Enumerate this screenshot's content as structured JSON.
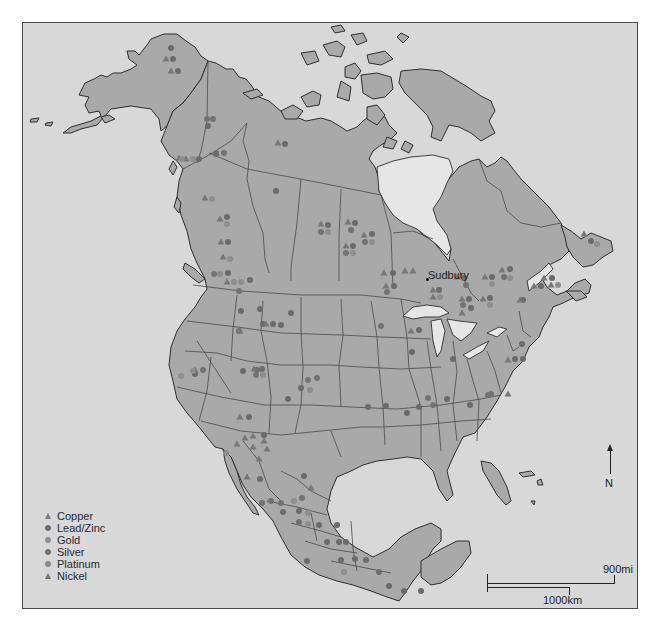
{
  "map": {
    "title": "North American mineral deposits",
    "colors": {
      "ocean": "#d8d8d8",
      "land": "#a9a9a9",
      "lakes": "#e6e6e6",
      "outline": "#2e2e2e",
      "symbol_dark": "#6e6e6e",
      "symbol_light": "#8d8d8d"
    },
    "labels": [
      {
        "name": "Sudbury",
        "x": 428,
        "y": 270,
        "dot_x": 426,
        "dot_y": 278
      }
    ]
  },
  "legend": {
    "items": [
      {
        "label": "Copper",
        "shape": "triangle",
        "color": "#7a7a7a"
      },
      {
        "label": "Lead/Zinc",
        "shape": "circle",
        "color": "#6e6e6e"
      },
      {
        "label": "Gold",
        "shape": "circle",
        "color": "#8f8f8f"
      },
      {
        "label": "Silver",
        "shape": "circle",
        "color": "#747474"
      },
      {
        "label": "Platinum",
        "shape": "circle",
        "color": "#8a8a8a"
      },
      {
        "label": "Nickel",
        "shape": "triangle",
        "color": "#6f6f6f"
      }
    ]
  },
  "north_arrow": {
    "label": "N"
  },
  "scale_bar": {
    "miles_label": "900mi",
    "km_label": "1000km"
  },
  "deposits": [
    {
      "t": "lead",
      "x": 170,
      "y": 47
    },
    {
      "t": "copper",
      "x": 165,
      "y": 58
    },
    {
      "t": "lead",
      "x": 172,
      "y": 58
    },
    {
      "t": "copper",
      "x": 170,
      "y": 70
    },
    {
      "t": "lead",
      "x": 177,
      "y": 70
    },
    {
      "t": "silver",
      "x": 206,
      "y": 118
    },
    {
      "t": "silver",
      "x": 212,
      "y": 118
    },
    {
      "t": "copper",
      "x": 185,
      "y": 158
    },
    {
      "t": "gold",
      "x": 192,
      "y": 158
    },
    {
      "t": "lead",
      "x": 198,
      "y": 158
    },
    {
      "t": "lead",
      "x": 207,
      "y": 125
    },
    {
      "t": "silver",
      "x": 215,
      "y": 152
    },
    {
      "t": "silver",
      "x": 223,
      "y": 152
    },
    {
      "t": "lead",
      "x": 215,
      "y": 153
    },
    {
      "t": "copper",
      "x": 178,
      "y": 157
    },
    {
      "t": "gold",
      "x": 181,
      "y": 158
    },
    {
      "t": "copper",
      "x": 277,
      "y": 142
    },
    {
      "t": "lead",
      "x": 284,
      "y": 143
    },
    {
      "t": "lead",
      "x": 275,
      "y": 190
    },
    {
      "t": "copper",
      "x": 204,
      "y": 197
    },
    {
      "t": "gold",
      "x": 211,
      "y": 198
    },
    {
      "t": "copper",
      "x": 219,
      "y": 218
    },
    {
      "t": "lead",
      "x": 226,
      "y": 216
    },
    {
      "t": "gold",
      "x": 226,
      "y": 223
    },
    {
      "t": "copper",
      "x": 220,
      "y": 241
    },
    {
      "t": "lead",
      "x": 227,
      "y": 241
    },
    {
      "t": "copper",
      "x": 222,
      "y": 256
    },
    {
      "t": "gold",
      "x": 229,
      "y": 258
    },
    {
      "t": "gold",
      "x": 219,
      "y": 273
    },
    {
      "t": "lead",
      "x": 227,
      "y": 272
    },
    {
      "t": "silver",
      "x": 213,
      "y": 273
    },
    {
      "t": "copper",
      "x": 226,
      "y": 281
    },
    {
      "t": "gold",
      "x": 233,
      "y": 281
    },
    {
      "t": "gold",
      "x": 240,
      "y": 281
    },
    {
      "t": "lead",
      "x": 249,
      "y": 279
    },
    {
      "t": "silver",
      "x": 238,
      "y": 290
    },
    {
      "t": "copper",
      "x": 320,
      "y": 223
    },
    {
      "t": "lead",
      "x": 327,
      "y": 224
    },
    {
      "t": "silver",
      "x": 320,
      "y": 231
    },
    {
      "t": "gold",
      "x": 327,
      "y": 231
    },
    {
      "t": "copper",
      "x": 347,
      "y": 221
    },
    {
      "t": "lead",
      "x": 354,
      "y": 222
    },
    {
      "t": "silver",
      "x": 350,
      "y": 229
    },
    {
      "t": "copper",
      "x": 363,
      "y": 234
    },
    {
      "t": "lead",
      "x": 371,
      "y": 233
    },
    {
      "t": "silver",
      "x": 364,
      "y": 241
    },
    {
      "t": "gold",
      "x": 371,
      "y": 241
    },
    {
      "t": "copper",
      "x": 345,
      "y": 245
    },
    {
      "t": "lead",
      "x": 352,
      "y": 245
    },
    {
      "t": "silver",
      "x": 345,
      "y": 252
    },
    {
      "t": "gold",
      "x": 352,
      "y": 252
    },
    {
      "t": "copper",
      "x": 383,
      "y": 272
    },
    {
      "t": "lead",
      "x": 392,
      "y": 272
    },
    {
      "t": "copper",
      "x": 404,
      "y": 270
    },
    {
      "t": "copper",
      "x": 412,
      "y": 270
    },
    {
      "t": "copper",
      "x": 385,
      "y": 285
    },
    {
      "t": "lead",
      "x": 393,
      "y": 285
    },
    {
      "t": "silver",
      "x": 386,
      "y": 291
    },
    {
      "t": "copper",
      "x": 456,
      "y": 276
    },
    {
      "t": "lead",
      "x": 463,
      "y": 277
    },
    {
      "t": "silver",
      "x": 465,
      "y": 284
    },
    {
      "t": "copper",
      "x": 484,
      "y": 276
    },
    {
      "t": "lead",
      "x": 491,
      "y": 276
    },
    {
      "t": "gold",
      "x": 491,
      "y": 283
    },
    {
      "t": "copper",
      "x": 501,
      "y": 269
    },
    {
      "t": "lead",
      "x": 509,
      "y": 268
    },
    {
      "t": "silver",
      "x": 503,
      "y": 276
    },
    {
      "t": "gold",
      "x": 509,
      "y": 277
    },
    {
      "t": "copper",
      "x": 461,
      "y": 298
    },
    {
      "t": "lead",
      "x": 468,
      "y": 298
    },
    {
      "t": "silver",
      "x": 462,
      "y": 304
    },
    {
      "t": "copper",
      "x": 482,
      "y": 298
    },
    {
      "t": "lead",
      "x": 489,
      "y": 297
    },
    {
      "t": "gold",
      "x": 489,
      "y": 304
    },
    {
      "t": "copper",
      "x": 432,
      "y": 289
    },
    {
      "t": "lead",
      "x": 438,
      "y": 289
    },
    {
      "t": "copper",
      "x": 432,
      "y": 296
    },
    {
      "t": "gold",
      "x": 439,
      "y": 296
    },
    {
      "t": "copper",
      "x": 461,
      "y": 312
    },
    {
      "t": "lead",
      "x": 470,
      "y": 307
    },
    {
      "t": "copper",
      "x": 543,
      "y": 277
    },
    {
      "t": "lead",
      "x": 551,
      "y": 277
    },
    {
      "t": "copper",
      "x": 550,
      "y": 284
    },
    {
      "t": "gold",
      "x": 557,
      "y": 284
    },
    {
      "t": "copper",
      "x": 583,
      "y": 233
    },
    {
      "t": "lead",
      "x": 590,
      "y": 240
    },
    {
      "t": "gold",
      "x": 596,
      "y": 243
    },
    {
      "t": "copper",
      "x": 533,
      "y": 285
    },
    {
      "t": "lead",
      "x": 540,
      "y": 285
    },
    {
      "t": "lead",
      "x": 522,
      "y": 299
    },
    {
      "t": "copper",
      "x": 519,
      "y": 299
    },
    {
      "t": "silver",
      "x": 380,
      "y": 325
    },
    {
      "t": "copper",
      "x": 410,
      "y": 330
    },
    {
      "t": "lead",
      "x": 418,
      "y": 329
    },
    {
      "t": "lead",
      "x": 411,
      "y": 351
    },
    {
      "t": "lead",
      "x": 452,
      "y": 358
    },
    {
      "t": "lead",
      "x": 521,
      "y": 343
    },
    {
      "t": "copper",
      "x": 507,
      "y": 359
    },
    {
      "t": "lead",
      "x": 514,
      "y": 358
    },
    {
      "t": "lead",
      "x": 522,
      "y": 358
    },
    {
      "t": "silver",
      "x": 427,
      "y": 397
    },
    {
      "t": "silver",
      "x": 432,
      "y": 404
    },
    {
      "t": "lead",
      "x": 418,
      "y": 406
    },
    {
      "t": "lead",
      "x": 406,
      "y": 412
    },
    {
      "t": "lead",
      "x": 385,
      "y": 405
    },
    {
      "t": "lead",
      "x": 367,
      "y": 406
    },
    {
      "t": "lead",
      "x": 446,
      "y": 398
    },
    {
      "t": "lead",
      "x": 469,
      "y": 404
    },
    {
      "t": "silver",
      "x": 487,
      "y": 394
    },
    {
      "t": "silver",
      "x": 490,
      "y": 393
    },
    {
      "t": "copper",
      "x": 507,
      "y": 393
    },
    {
      "t": "gold",
      "x": 238,
      "y": 330
    },
    {
      "t": "lead",
      "x": 240,
      "y": 310
    },
    {
      "t": "lead",
      "x": 259,
      "y": 308
    },
    {
      "t": "lead",
      "x": 262,
      "y": 323
    },
    {
      "t": "copper",
      "x": 265,
      "y": 323
    },
    {
      "t": "lead",
      "x": 272,
      "y": 323
    },
    {
      "t": "lead",
      "x": 280,
      "y": 324
    },
    {
      "t": "lead",
      "x": 290,
      "y": 312
    },
    {
      "t": "silver",
      "x": 238,
      "y": 330
    },
    {
      "t": "copper",
      "x": 239,
      "y": 330
    },
    {
      "t": "lead",
      "x": 256,
      "y": 369
    },
    {
      "t": "copper",
      "x": 253,
      "y": 368
    },
    {
      "t": "lead",
      "x": 261,
      "y": 368
    },
    {
      "t": "silver",
      "x": 255,
      "y": 374
    },
    {
      "t": "gold",
      "x": 262,
      "y": 374
    },
    {
      "t": "lead",
      "x": 242,
      "y": 370
    },
    {
      "t": "silver",
      "x": 307,
      "y": 379
    },
    {
      "t": "silver",
      "x": 316,
      "y": 377
    },
    {
      "t": "lead",
      "x": 300,
      "y": 387
    },
    {
      "t": "gold",
      "x": 309,
      "y": 389
    },
    {
      "t": "lead",
      "x": 287,
      "y": 398
    },
    {
      "t": "copper",
      "x": 194,
      "y": 369
    },
    {
      "t": "lead",
      "x": 194,
      "y": 373
    },
    {
      "t": "gold",
      "x": 192,
      "y": 370
    },
    {
      "t": "gold",
      "x": 180,
      "y": 375
    },
    {
      "t": "silver",
      "x": 202,
      "y": 369
    },
    {
      "t": "copper",
      "x": 239,
      "y": 416
    },
    {
      "t": "lead",
      "x": 248,
      "y": 416
    },
    {
      "t": "copper",
      "x": 244,
      "y": 437
    },
    {
      "t": "copper",
      "x": 252,
      "y": 435
    },
    {
      "t": "lead",
      "x": 263,
      "y": 434
    },
    {
      "t": "copper",
      "x": 236,
      "y": 443
    },
    {
      "t": "copper",
      "x": 252,
      "y": 446
    },
    {
      "t": "copper",
      "x": 266,
      "y": 448
    },
    {
      "t": "copper",
      "x": 258,
      "y": 458
    },
    {
      "t": "copper",
      "x": 246,
      "y": 476
    },
    {
      "t": "lead",
      "x": 259,
      "y": 478
    },
    {
      "t": "copper",
      "x": 263,
      "y": 440
    },
    {
      "t": "gold",
      "x": 225,
      "y": 452
    },
    {
      "t": "lead",
      "x": 303,
      "y": 475
    },
    {
      "t": "copper",
      "x": 310,
      "y": 487
    },
    {
      "t": "silver",
      "x": 301,
      "y": 497
    },
    {
      "t": "silver",
      "x": 261,
      "y": 502
    },
    {
      "t": "silver",
      "x": 270,
      "y": 500
    },
    {
      "t": "gold",
      "x": 293,
      "y": 500
    },
    {
      "t": "silver",
      "x": 280,
      "y": 502
    },
    {
      "t": "lead",
      "x": 298,
      "y": 510
    },
    {
      "t": "gold",
      "x": 307,
      "y": 512
    },
    {
      "t": "silver",
      "x": 298,
      "y": 521
    },
    {
      "t": "gold",
      "x": 307,
      "y": 523
    },
    {
      "t": "lead",
      "x": 282,
      "y": 511
    },
    {
      "t": "lead",
      "x": 318,
      "y": 524
    },
    {
      "t": "lead",
      "x": 336,
      "y": 524
    },
    {
      "t": "lead",
      "x": 326,
      "y": 541
    },
    {
      "t": "lead",
      "x": 338,
      "y": 541
    },
    {
      "t": "lead",
      "x": 345,
      "y": 541
    },
    {
      "t": "lead",
      "x": 306,
      "y": 560
    },
    {
      "t": "lead",
      "x": 340,
      "y": 559
    },
    {
      "t": "lead",
      "x": 354,
      "y": 558
    },
    {
      "t": "gold",
      "x": 343,
      "y": 571
    },
    {
      "t": "lead",
      "x": 365,
      "y": 559
    },
    {
      "t": "lead",
      "x": 378,
      "y": 571
    },
    {
      "t": "lead",
      "x": 388,
      "y": 585
    },
    {
      "t": "lead",
      "x": 403,
      "y": 590
    },
    {
      "t": "lead",
      "x": 420,
      "y": 590
    }
  ]
}
